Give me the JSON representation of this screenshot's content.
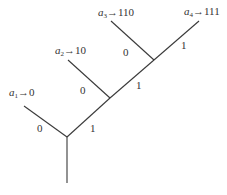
{
  "diagram": {
    "type": "binary-code-tree",
    "leaves": [
      {
        "symbol": "a",
        "index": "1",
        "arrow": "→",
        "code": "0"
      },
      {
        "symbol": "a",
        "index": "2",
        "arrow": "→",
        "code": "10"
      },
      {
        "symbol": "a",
        "index": "3",
        "arrow": "→",
        "code": "110"
      },
      {
        "symbol": "a",
        "index": "4",
        "arrow": "→",
        "code": "111"
      }
    ],
    "edge_labels": [
      {
        "id": "n1-left",
        "text": "0"
      },
      {
        "id": "n1-right",
        "text": "1"
      },
      {
        "id": "n2-left",
        "text": "0"
      },
      {
        "id": "n2-right",
        "text": "1"
      },
      {
        "id": "n3-left",
        "text": "0"
      },
      {
        "id": "n3-right",
        "text": "1"
      }
    ],
    "colors": {
      "line": "#3a3a3a",
      "text": "#333333",
      "background": "#ffffff"
    }
  }
}
